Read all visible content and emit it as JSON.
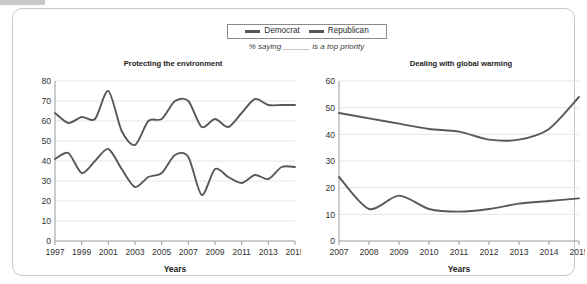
{
  "figure": {
    "subtitle": "% saying ______ is a top priority",
    "legend": [
      {
        "label": "Democrat",
        "color": "#585858"
      },
      {
        "label": "Republican",
        "color": "#585858"
      }
    ],
    "axis_label": "Years",
    "line_color": "#585858",
    "grid_color": "#dedede",
    "axis_color": "#9a9a9a"
  },
  "chart_data": [
    {
      "type": "line",
      "title": "Protecting the environment",
      "xlabel": "Years",
      "ylabel": "",
      "xlim": [
        1997,
        2015
      ],
      "ylim": [
        0,
        80
      ],
      "yticks": [
        0,
        10,
        20,
        30,
        40,
        50,
        60,
        70,
        80
      ],
      "xticks": [
        1997,
        1999,
        2001,
        2003,
        2005,
        2007,
        2009,
        2011,
        2013,
        2015
      ],
      "grid": true,
      "legend_position": "top-center-shared",
      "x": [
        1997,
        1998,
        1999,
        2000,
        2001,
        2002,
        2003,
        2004,
        2005,
        2006,
        2007,
        2008,
        2009,
        2010,
        2011,
        2012,
        2013,
        2014,
        2015
      ],
      "series": [
        {
          "name": "Democrat",
          "values": [
            64,
            59,
            62,
            61,
            75,
            55,
            48,
            60,
            61,
            70,
            70,
            57,
            61,
            57,
            64,
            71,
            68,
            68,
            68
          ]
        },
        {
          "name": "Republican",
          "values": [
            41,
            44,
            34,
            40,
            46,
            36,
            27,
            32,
            34,
            43,
            42,
            23,
            36,
            32,
            29,
            33,
            31,
            37,
            37
          ]
        }
      ]
    },
    {
      "type": "line",
      "title": "Dealing with global warming",
      "xlabel": "Years",
      "ylabel": "",
      "xlim": [
        2007,
        2015
      ],
      "ylim": [
        0,
        60
      ],
      "yticks": [
        0,
        10,
        20,
        30,
        40,
        50,
        60
      ],
      "xticks": [
        2007,
        2008,
        2009,
        2010,
        2011,
        2012,
        2013,
        2014,
        2015
      ],
      "grid": true,
      "legend_position": "top-center-shared",
      "x": [
        2007,
        2008,
        2009,
        2010,
        2011,
        2012,
        2013,
        2014,
        2015
      ],
      "series": [
        {
          "name": "Democrat",
          "values": [
            48,
            46,
            44,
            42,
            41,
            38,
            38,
            42,
            54
          ]
        },
        {
          "name": "Republican",
          "values": [
            24,
            12,
            17,
            12,
            11,
            12,
            14,
            15,
            16
          ]
        }
      ]
    }
  ]
}
